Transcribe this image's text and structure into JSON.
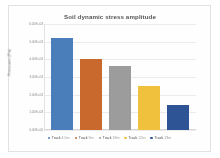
{
  "chart_data": {
    "type": "bar",
    "title": "Soil dynamic stress amplitude",
    "xlabel": "",
    "ylabel": "Pressure (Pa)",
    "categories": [
      "Track 4.5m",
      "Track 9m",
      "Track 18m",
      "Track 22m",
      "Track 23m"
    ],
    "values": [
      5200,
      4000,
      3650,
      2500,
      1400
    ],
    "ylim": [
      0,
      6000
    ],
    "yticks": [
      0,
      1000,
      2000,
      3000,
      4000,
      5000,
      6000
    ],
    "ytick_labels": [
      "0.00E+00",
      "1.00E+03",
      "2.00E+03",
      "3.00E+03",
      "4.00E+03",
      "5.00E+03",
      "6.00E+03"
    ],
    "grid": true,
    "legend_position": "bottom",
    "series": [
      {
        "name": "Soil dynamic stress amplitude",
        "values": [
          5200,
          4000,
          3650,
          2500,
          1400
        ]
      }
    ],
    "bar_colors": [
      "#4A7EBB",
      "#C9692E",
      "#9C9C9C",
      "#F0C13C",
      "#2E5496"
    ]
  },
  "legend": {
    "items": [
      {
        "prefix": "Track",
        "depth": "4.5m",
        "color": "#4A7EBB"
      },
      {
        "prefix": "Track",
        "depth": "9m",
        "color": "#C9692E"
      },
      {
        "prefix": "Track",
        "depth": "18m",
        "color": "#9C9C9C"
      },
      {
        "prefix": "Track",
        "depth": "22m",
        "color": "#F0C13C"
      },
      {
        "prefix": "Track",
        "depth": "23m",
        "color": "#2E5496"
      }
    ]
  }
}
